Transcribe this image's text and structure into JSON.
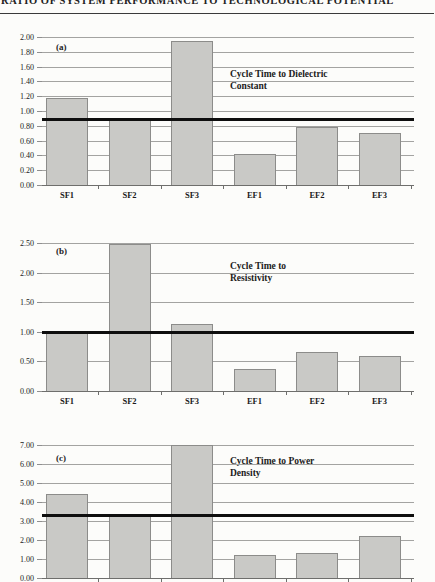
{
  "page": {
    "header_title": "RATIO OF SYSTEM PERFORMANCE TO TECHNOLOGICAL POTENTIAL"
  },
  "colors": {
    "background": "#fcfcfa",
    "bar_fill": "#c9c9c6",
    "bar_border": "#8c8c8a",
    "gridline": "#a3a3a1",
    "reference_line": "#0e0e0e",
    "text": "#1b1b1b"
  },
  "chart_data": [
    {
      "type": "bar",
      "panel": "(a)",
      "title": "Cycle Time to Dielectric Constant",
      "annotation_lines": [
        "Cycle Time to Dielectric",
        "Constant"
      ],
      "categories": [
        "SF1",
        "SF2",
        "SF3",
        "EF1",
        "EF2",
        "EF3"
      ],
      "values": [
        1.17,
        0.88,
        1.95,
        0.42,
        0.78,
        0.7
      ],
      "reference_line": 0.89,
      "ylim": [
        0,
        2.0
      ],
      "y_step": 0.2,
      "tick_format_decimals": 2,
      "grid": true,
      "show_x_labels": true
    },
    {
      "type": "bar",
      "panel": "(b)",
      "title": "Cycle Time to Resistivity",
      "annotation_lines": [
        "Cycle Time to",
        "Resistivity"
      ],
      "categories": [
        "SF1",
        "SF2",
        "SF3",
        "EF1",
        "EF2",
        "EF3"
      ],
      "values": [
        1.0,
        2.48,
        1.13,
        0.38,
        0.66,
        0.59
      ],
      "reference_line": 1.0,
      "ylim": [
        0,
        2.5
      ],
      "y_step": 0.5,
      "tick_format_decimals": 2,
      "grid": true,
      "show_x_labels": true
    },
    {
      "type": "bar",
      "panel": "(c)",
      "title": "Cycle Time to Power Density",
      "annotation_lines": [
        "Cycle Time to Power",
        "Density"
      ],
      "categories": [
        "SF1",
        "SF2",
        "SF3",
        "EF1",
        "EF2",
        "EF3"
      ],
      "values": [
        4.4,
        3.3,
        7.0,
        1.2,
        1.32,
        2.2
      ],
      "reference_line": 3.3,
      "ylim": [
        0,
        7.0
      ],
      "y_step": 1.0,
      "tick_format_decimals": 2,
      "grid": true,
      "show_x_labels": false
    }
  ]
}
